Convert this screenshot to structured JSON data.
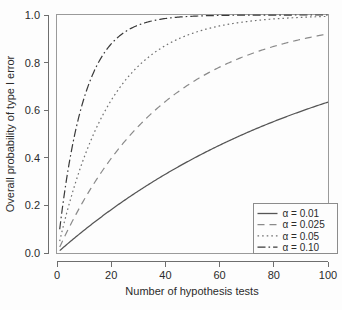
{
  "chart_data": {
    "type": "line",
    "title": "",
    "subtitle": "",
    "xlabel": "Number of hypothesis tests",
    "ylabel": "Overall probability of type I error",
    "xlim": [
      0,
      100
    ],
    "ylim": [
      0.0,
      1.0
    ],
    "xticks": [
      0,
      20,
      40,
      60,
      80,
      100
    ],
    "xtick_labels": [
      "0",
      "20",
      "40",
      "60",
      "80",
      "100"
    ],
    "yticks": [
      0.0,
      0.2,
      0.4,
      0.6,
      0.8,
      1.0
    ],
    "ytick_labels": [
      "0.0",
      "0.2",
      "0.4",
      "0.6",
      "0.8",
      "1.0"
    ],
    "grid": false,
    "legend_position": "bottom-right",
    "formula": "P = 1 - (1 - alpha)^n",
    "x": [
      1,
      2,
      3,
      4,
      5,
      6,
      7,
      8,
      9,
      10,
      12,
      14,
      16,
      18,
      20,
      25,
      30,
      35,
      40,
      45,
      50,
      55,
      60,
      65,
      70,
      75,
      80,
      85,
      90,
      95,
      100
    ],
    "series": [
      {
        "name": "alpha = 0.01",
        "label": "α = 0.01",
        "alpha": 0.01,
        "style": "solid",
        "dash": "none",
        "color": "#555555",
        "values": [
          0.01,
          0.02,
          0.03,
          0.039,
          0.049,
          0.059,
          0.068,
          0.077,
          0.086,
          0.096,
          0.114,
          0.131,
          0.149,
          0.165,
          0.182,
          0.222,
          0.26,
          0.297,
          0.331,
          0.364,
          0.395,
          0.425,
          0.453,
          0.48,
          0.505,
          0.529,
          0.552,
          0.574,
          0.595,
          0.615,
          0.634
        ]
      },
      {
        "name": "alpha = 0.025",
        "label": "α = 0.025",
        "alpha": 0.025,
        "style": "dashed",
        "dash": "7,5",
        "color": "#8a8a8a",
        "values": [
          0.025,
          0.049,
          0.073,
          0.096,
          0.119,
          0.141,
          0.163,
          0.184,
          0.205,
          0.224,
          0.262,
          0.298,
          0.333,
          0.366,
          0.397,
          0.468,
          0.532,
          0.588,
          0.637,
          0.68,
          0.718,
          0.752,
          0.781,
          0.807,
          0.83,
          0.85,
          0.868,
          0.883,
          0.897,
          0.909,
          0.92
        ]
      },
      {
        "name": "alpha = 0.05",
        "label": "α = 0.05",
        "alpha": 0.05,
        "style": "dotted",
        "dash": "1.6,3",
        "color": "#707070",
        "values": [
          0.05,
          0.098,
          0.143,
          0.185,
          0.226,
          0.265,
          0.302,
          0.337,
          0.37,
          0.401,
          0.46,
          0.512,
          0.56,
          0.603,
          0.642,
          0.723,
          0.785,
          0.834,
          0.871,
          0.901,
          0.923,
          0.94,
          0.954,
          0.965,
          0.972,
          0.979,
          0.983,
          0.987,
          0.99,
          0.993,
          0.994
        ]
      },
      {
        "name": "alpha = 0.10",
        "label": "α = 0.10",
        "alpha": 0.1,
        "style": "dashdot",
        "dash": "8,3,1.6,3",
        "color": "#3a3a3a",
        "values": [
          0.1,
          0.19,
          0.271,
          0.344,
          0.41,
          0.469,
          0.522,
          0.57,
          0.613,
          0.651,
          0.718,
          0.771,
          0.815,
          0.85,
          0.878,
          0.928,
          0.958,
          0.975,
          0.985,
          0.991,
          0.995,
          0.997,
          0.998,
          0.999,
          0.999,
          1.0,
          1.0,
          1.0,
          1.0,
          1.0,
          1.0
        ]
      }
    ]
  },
  "legend": {
    "entries": [
      {
        "label": "α = 0.01"
      },
      {
        "label": "α = 0.025"
      },
      {
        "label": "α = 0.05"
      },
      {
        "label": "α = 0.10"
      }
    ]
  },
  "colors": {
    "background": "#fdfdfd",
    "axis": "#6e6e6e",
    "frame": "#9a9a9a",
    "text": "#2b2b2b"
  }
}
